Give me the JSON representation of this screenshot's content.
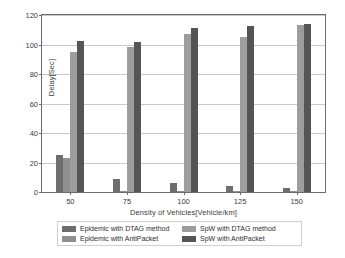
{
  "chart_data": {
    "type": "bar",
    "title": "",
    "subtitle": "",
    "xlabel": "Density of Vehicles[Vehicle/km]",
    "ylabel": "Delay[Sec]",
    "categories": [
      "50",
      "75",
      "100",
      "125",
      "150"
    ],
    "ylim": [
      0,
      120
    ],
    "yticks": [
      "0",
      "20",
      "40",
      "60",
      "80",
      "100",
      "120"
    ],
    "grid": "horizontal",
    "legend_position": "bottom",
    "series": [
      {
        "name": "Epidemic with DTAG method",
        "color": "#6e6e6e",
        "values": [
          25,
          9,
          6,
          4,
          2.5
        ]
      },
      {
        "name": "Epidemic with AntiPacket",
        "color": "#8f8f8f",
        "values": [
          23,
          0.6,
          0.5,
          0.4,
          0.4
        ]
      },
      {
        "name": "SpW with DTAG method",
        "color": "#9d9d9d",
        "values": [
          95,
          98,
          107,
          105,
          113.5
        ]
      },
      {
        "name": "SpW with AntiPacket",
        "color": "#555555",
        "values": [
          102.5,
          101.5,
          111,
          112.5,
          114
        ]
      }
    ]
  },
  "axes": {
    "y_label": "Delay[Sec]",
    "x_label": "Density of Vehicles[Vehicle/km]",
    "y_ticks": [
      "120",
      "100",
      "80",
      "60",
      "40",
      "20",
      "0"
    ],
    "x_ticks": [
      "50",
      "75",
      "100",
      "125",
      "150"
    ]
  },
  "legend": {
    "entries": [
      {
        "label": "Epidemic with DTAG method",
        "color": "#6e6e6e"
      },
      {
        "label": "SpW with DTAG method",
        "color": "#9d9d9d"
      },
      {
        "label": "Epidemic with AntiPacket",
        "color": "#8f8f8f"
      },
      {
        "label": "SpW with AntiPacket",
        "color": "#555555"
      }
    ]
  },
  "colors": {
    "axis": "#6b6b6b",
    "grid": "#c9c9c9",
    "text": "#3c3c3c",
    "background": "#ffffff"
  }
}
